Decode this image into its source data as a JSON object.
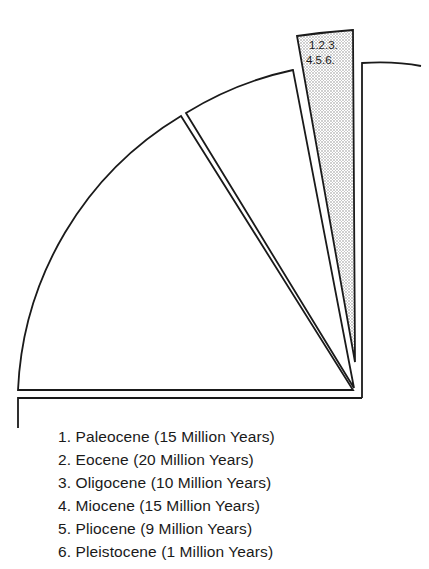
{
  "diagram": {
    "title": "",
    "colors": {
      "stroke": "#1a1a1a",
      "background": "#ffffff",
      "shaded_fill": "#cfcfcf"
    },
    "wedges": [
      {
        "id": "large-wedge-left",
        "label": ""
      },
      {
        "id": "middle-wedge",
        "label": ""
      },
      {
        "id": "shaded-wedge",
        "label_line1": "1.2.3.",
        "label_line2": "4.5.6."
      }
    ]
  },
  "legend": {
    "items": [
      {
        "number": "1.",
        "text": "Paleocene (15 Million Years)",
        "epoch": "Paleocene",
        "duration_million_years": 15
      },
      {
        "number": "2.",
        "text": "Eocene (20 Million Years)",
        "epoch": "Eocene",
        "duration_million_years": 20
      },
      {
        "number": "3.",
        "text": "Oligocene (10 Million Years)",
        "epoch": "Oligocene",
        "duration_million_years": 10
      },
      {
        "number": "4.",
        "text": "Miocene (15 Million Years)",
        "epoch": "Miocene",
        "duration_million_years": 15
      },
      {
        "number": "5.",
        "text": "Pliocene (9 Million Years)",
        "epoch": "Pliocene",
        "duration_million_years": 9
      },
      {
        "number": "6.",
        "text": "Pleistocene (1 Million Years)",
        "epoch": "Pleistocene",
        "duration_million_years": 1
      }
    ]
  }
}
